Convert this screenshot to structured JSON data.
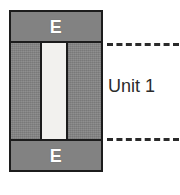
{
  "diagram": {
    "element": {
      "name": "structural-wall-element",
      "zones": [
        {
          "id": "top",
          "label": "E"
        },
        {
          "id": "bottom",
          "label": "E"
        }
      ],
      "web": {
        "label": ""
      },
      "colors": {
        "zone_fill": "#828282",
        "body_fill": "#848484",
        "web_fill": "#f2f1ee",
        "outline": "#1c1c1c",
        "zone_label_color": "#ffffff"
      }
    },
    "callout": {
      "label": "Unit 1",
      "leader_style": "dashed",
      "leader_color": "#2a2a2a",
      "leaders": [
        {
          "id": "top-leader"
        },
        {
          "id": "bottom-leader"
        }
      ]
    }
  }
}
